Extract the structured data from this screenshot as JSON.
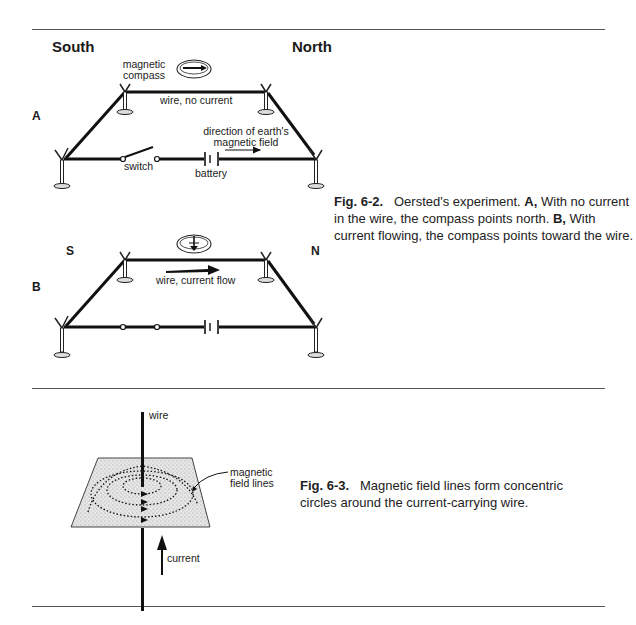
{
  "fig62": {
    "labels": {
      "south": "South",
      "north": "North",
      "panel_a": "A",
      "panel_b": "B",
      "s": "S",
      "n": "N",
      "magnetic_compass": "magnetic compass",
      "magnetic_line1": "magnetic",
      "magnetic_line2": "compass",
      "wire_no_current": "wire, no current",
      "direction_line1": "direction of earth's",
      "direction_line2": "magnetic field",
      "switch": "switch",
      "battery": "battery",
      "wire_current_flow": "wire, current flow"
    },
    "caption": {
      "fig": "Fig. 6-2.",
      "text1": "Oersted's experiment.",
      "a": "A,",
      "text2": "With no current in the wire, the compass points north.",
      "b": "B,",
      "text3": "With current flowing, the compass points toward the wire."
    }
  },
  "fig63": {
    "labels": {
      "wire": "wire",
      "field_line1": "magnetic",
      "field_line2": "field lines",
      "current": "current"
    },
    "caption": {
      "fig": "Fig. 6-3.",
      "text": "Magnetic field lines form concentric circles around the current-carrying wire."
    }
  }
}
